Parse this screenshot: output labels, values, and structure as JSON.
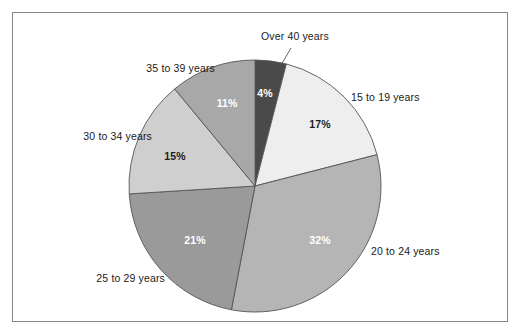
{
  "figure": {
    "frame_border_color": "#868686",
    "background_color": "#ffffff"
  },
  "chart_data": {
    "type": "pie",
    "title": "",
    "subtitle": "",
    "xlabel": "",
    "ylabel": "",
    "legend_position": "none",
    "grid": false,
    "labels_outside": true,
    "start_angle_deg": 0,
    "direction": "clockwise",
    "categories": [
      "Over 40 years",
      "15 to 19 years",
      "20 to 24 years",
      "25 to 29 years",
      "30 to 34 years",
      "35 to 39 years"
    ],
    "values": [
      4,
      17,
      32,
      21,
      15,
      11
    ],
    "value_labels": [
      "4%",
      "17%",
      "32%",
      "21%",
      "15%",
      "11%"
    ],
    "colors": [
      "#4a4a4a",
      "#eeeeee",
      "#b5b5b5",
      "#9a9a9a",
      "#cfcfcf",
      "#a8a8a8"
    ],
    "slices": [
      {
        "name": "Over 40 years",
        "value": 4,
        "value_label": "4%",
        "color": "#4a4a4a",
        "label_text_color": "#ffffff",
        "has_leader_line": true
      },
      {
        "name": "15 to 19 years",
        "value": 17,
        "value_label": "17%",
        "color": "#eeeeee",
        "label_text_color": "#1c1c1c",
        "has_leader_line": false
      },
      {
        "name": "20 to 24 years",
        "value": 32,
        "value_label": "32%",
        "color": "#b5b5b5",
        "label_text_color": "#ffffff",
        "has_leader_line": false
      },
      {
        "name": "25 to 29 years",
        "value": 21,
        "value_label": "21%",
        "color": "#9a9a9a",
        "label_text_color": "#ffffff",
        "has_leader_line": false
      },
      {
        "name": "30 to 34 years",
        "value": 15,
        "value_label": "15%",
        "color": "#cfcfcf",
        "label_text_color": "#1c1c1c",
        "has_leader_line": false
      },
      {
        "name": "35 to 39 years",
        "value": 11,
        "value_label": "11%",
        "color": "#a8a8a8",
        "label_text_color": "#ffffff",
        "has_leader_line": false
      }
    ]
  }
}
